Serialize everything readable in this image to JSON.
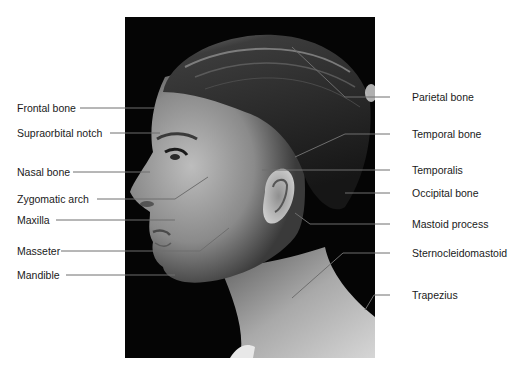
{
  "figure": {
    "photo_style": "black-and-white photograph, black background",
    "line_color": "#6e6e6e",
    "text_color": "#1a1a1a"
  },
  "labels_left": [
    {
      "text": "Frontal bone",
      "x": 17,
      "y": 102,
      "line": [
        [
          80,
          108
        ],
        [
          155,
          108
        ]
      ]
    },
    {
      "text": "Supraorbital notch",
      "x": 17,
      "y": 127,
      "line": [
        [
          110,
          133
        ],
        [
          160,
          133
        ]
      ]
    },
    {
      "text": "Nasal bone",
      "x": 17,
      "y": 166,
      "line": [
        [
          73,
          172
        ],
        [
          150,
          172
        ]
      ]
    },
    {
      "text": "Zygomatic arch",
      "x": 17,
      "y": 193,
      "line": [
        [
          97,
          199
        ],
        [
          175,
          199
        ],
        [
          208,
          177
        ]
      ]
    },
    {
      "text": "Maxilla",
      "x": 17,
      "y": 214,
      "line": [
        [
          56,
          220
        ],
        [
          175,
          220
        ]
      ]
    },
    {
      "text": "Masseter",
      "x": 17,
      "y": 245,
      "line": [
        [
          61,
          251
        ],
        [
          200,
          251
        ],
        [
          229,
          228
        ]
      ]
    },
    {
      "text": "Mandible",
      "x": 17,
      "y": 269,
      "line": [
        [
          66,
          275
        ],
        [
          175,
          275
        ]
      ]
    }
  ],
  "labels_right": [
    {
      "text": "Parietal bone",
      "x": 412,
      "y": 91,
      "line": [
        [
          390,
          97
        ],
        [
          372,
          97
        ],
        [
          345,
          96
        ],
        [
          292,
          47
        ]
      ]
    },
    {
      "text": "Temporal bone",
      "x": 412,
      "y": 128,
      "line": [
        [
          390,
          134
        ],
        [
          345,
          134
        ],
        [
          295,
          157
        ]
      ]
    },
    {
      "text": "Temporalis",
      "x": 412,
      "y": 164,
      "line": [
        [
          390,
          170
        ],
        [
          262,
          170
        ]
      ]
    },
    {
      "text": "Occipital bone",
      "x": 412,
      "y": 187,
      "line": [
        [
          390,
          193
        ],
        [
          345,
          193
        ]
      ]
    },
    {
      "text": "Mastoid process",
      "x": 412,
      "y": 218,
      "line": [
        [
          390,
          224
        ],
        [
          310,
          224
        ],
        [
          295,
          213
        ]
      ]
    },
    {
      "text": "Sternocleidomastoid",
      "x": 412,
      "y": 247,
      "line": [
        [
          390,
          253
        ],
        [
          343,
          253
        ],
        [
          292,
          298
        ]
      ]
    },
    {
      "text": "Trapezius",
      "x": 412,
      "y": 289,
      "line": [
        [
          390,
          295
        ],
        [
          374,
          295
        ],
        [
          365,
          310
        ]
      ]
    }
  ]
}
